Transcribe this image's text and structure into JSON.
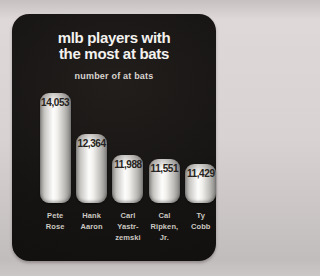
{
  "chart_data": {
    "type": "bar",
    "title": "mlb players with the most at bats",
    "title_lines": [
      "mlb players with",
      "the most at bats"
    ],
    "subtitle": "number of at bats",
    "xlabel": "",
    "ylabel": "number of at bats",
    "grid": false,
    "legend": null,
    "categories": [
      "Pete Rose",
      "Hank Aaron",
      "Carl Yastrzemski",
      "Cal Ripken, Jr.",
      "Ty Cobb"
    ],
    "category_label_lines": [
      [
        "Pete",
        "Rose"
      ],
      [
        "Hank",
        "Aaron"
      ],
      [
        "Carl",
        "Yastr-",
        "zemski"
      ],
      [
        "Cal",
        "Ripken,",
        "Jr."
      ],
      [
        "Ty",
        "Cobb"
      ]
    ],
    "values": [
      14053,
      12364,
      11988,
      11551,
      11429
    ],
    "value_labels": [
      "14,053",
      "12,364",
      "11,988",
      "11,551",
      "11,429"
    ],
    "layout_hints": {
      "bar_heights_px": [
        110,
        69,
        48,
        44,
        39
      ],
      "baseline_truncated": true,
      "value_labels_inside_bar_top": true
    },
    "colors": {
      "page_background": "#d8d2d2",
      "card_background": "#161412",
      "bar_center": "#ffffff",
      "bar_edge": "#8e8c89",
      "title_text": "#f4f2ef",
      "subtitle_text": "#d9d5cf",
      "value_text": "#262320",
      "category_text": "#ccc8c2"
    }
  }
}
